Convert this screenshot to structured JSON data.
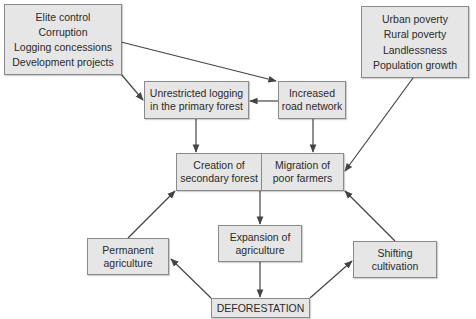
{
  "diagram": {
    "nodes": {
      "causes_left": {
        "lines": [
          "Elite control",
          "Corruption",
          "Logging concessions",
          "Development projects"
        ]
      },
      "causes_right": {
        "lines": [
          "Urban poverty",
          "Rural poverty",
          "Landlessness",
          "Population growth"
        ]
      },
      "unrestricted_logging": {
        "lines": [
          "Unrestricted logging",
          "in the primary forest"
        ]
      },
      "road_network": {
        "lines": [
          "Increased",
          "road network"
        ]
      },
      "secondary_forest": {
        "lines": [
          "Creation of",
          "secondary forest"
        ]
      },
      "migration": {
        "lines": [
          "Migration of",
          "poor farmers"
        ]
      },
      "permanent_agriculture": {
        "lines": [
          "Permanent",
          "agriculture"
        ]
      },
      "expansion_agriculture": {
        "lines": [
          "Expansion of",
          "agriculture"
        ]
      },
      "shifting_cultivation": {
        "lines": [
          "Shifting",
          "cultivation"
        ]
      },
      "deforestation": {
        "label": "DEFORESTATION"
      }
    },
    "edges": [
      {
        "from": "causes_left",
        "to": "road_network"
      },
      {
        "from": "causes_left",
        "to": "unrestricted_logging"
      },
      {
        "from": "road_network",
        "to": "unrestricted_logging"
      },
      {
        "from": "unrestricted_logging",
        "to": "secondary_forest"
      },
      {
        "from": "road_network",
        "to": "migration"
      },
      {
        "from": "causes_right",
        "to": "migration"
      },
      {
        "from": "migration",
        "to": "expansion_agriculture"
      },
      {
        "from": "expansion_agriculture",
        "to": "deforestation"
      },
      {
        "from": "deforestation",
        "to": "permanent_agriculture"
      },
      {
        "from": "deforestation",
        "to": "shifting_cultivation"
      },
      {
        "from": "permanent_agriculture",
        "to": "secondary_forest"
      },
      {
        "from": "shifting_cultivation",
        "to": "migration"
      }
    ],
    "colors": {
      "box_fill": "#e6e6e6",
      "box_border": "#8a8a8a",
      "line": "#444444"
    }
  }
}
